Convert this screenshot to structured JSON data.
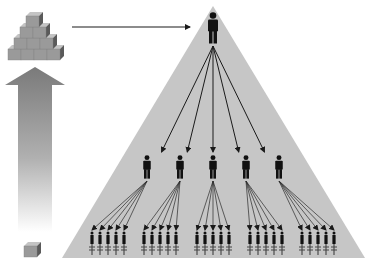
{
  "diagram": {
    "type": "hierarchy-pyramid",
    "colors": {
      "background": "#ffffff",
      "pyramid_fill": "#c6c6c6",
      "figure": "#111111",
      "arrow": "#1a1a1a",
      "block_front": "#9a9a9a",
      "block_top": "#c4c4c4",
      "block_side": "#5a5a5a"
    },
    "pyramid": {
      "apex": [
        213,
        6
      ],
      "base_left": [
        62,
        258
      ],
      "base_right": [
        365,
        258
      ]
    },
    "levels": [
      {
        "name": "top",
        "count": 1,
        "centers_x": [
          213
        ],
        "y": 12,
        "height": 32
      },
      {
        "name": "middle",
        "count": 5,
        "centers_x": [
          147,
          180,
          213,
          246,
          279
        ],
        "y": 155,
        "height": 24
      },
      {
        "name": "bottom",
        "count": 25,
        "group_centers_x": [
          108,
          160,
          213,
          266,
          318
        ],
        "per_group": 5,
        "spacing": 8,
        "y": 231,
        "height": 24
      }
    ],
    "left_graphic": {
      "block_stack_rows": [
        4,
        3,
        2,
        1
      ],
      "single_block": true,
      "growth_arrow": "up"
    },
    "connector_arrow": {
      "from": [
        72,
        27
      ],
      "to": [
        190,
        27
      ]
    }
  }
}
